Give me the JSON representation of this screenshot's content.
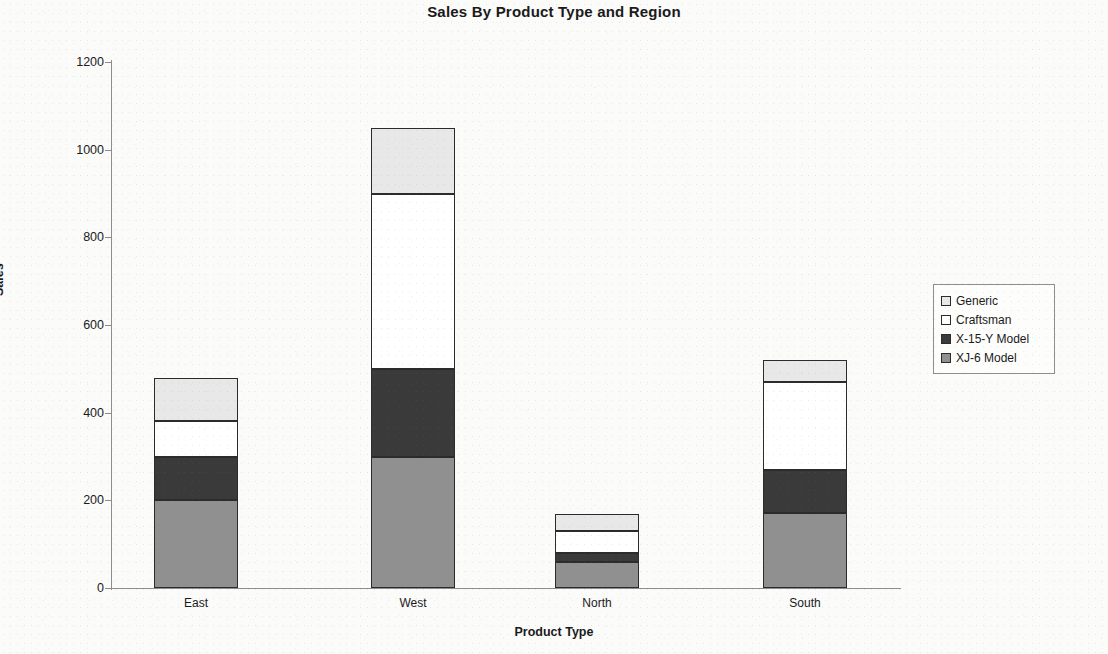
{
  "chart_data": {
    "type": "bar",
    "subtype": "stacked-vertical",
    "title": "Sales By Product Type and Region",
    "xlabel": "Product Type",
    "ylabel": "Sales",
    "categories": [
      "East",
      "West",
      "North",
      "South"
    ],
    "ylim": [
      0,
      1200
    ],
    "yticks": [
      0,
      200,
      400,
      600,
      800,
      1000,
      1200
    ],
    "ytick_labels": [
      "0",
      "200",
      "400",
      "600",
      "800",
      "1000",
      "1200"
    ],
    "grid": false,
    "legend_position": "right",
    "stack_order_bottom_to_top": [
      "XJ-6 Model",
      "X-15-Y Model",
      "Craftsman",
      "Generic"
    ],
    "series": [
      {
        "name": "Generic",
        "color": "#e8e8e8",
        "values": [
          100,
          150,
          40,
          50
        ]
      },
      {
        "name": "Craftsman",
        "color": "#ffffff",
        "values": [
          80,
          400,
          50,
          200
        ]
      },
      {
        "name": "X-15-Y Model",
        "color": "#3a3a3a",
        "values": [
          100,
          200,
          20,
          100
        ]
      },
      {
        "name": "XJ-6 Model",
        "color": "#909090",
        "values": [
          200,
          300,
          60,
          170
        ]
      }
    ],
    "totals": [
      480,
      1050,
      170,
      520
    ]
  },
  "legend": {
    "items": [
      {
        "label": "Generic",
        "swatch": "#e8e8e8"
      },
      {
        "label": "Craftsman",
        "swatch": "#ffffff"
      },
      {
        "label": "X-15-Y Model",
        "swatch": "#3a3a3a"
      },
      {
        "label": "XJ-6 Model",
        "swatch": "#909090"
      }
    ]
  }
}
